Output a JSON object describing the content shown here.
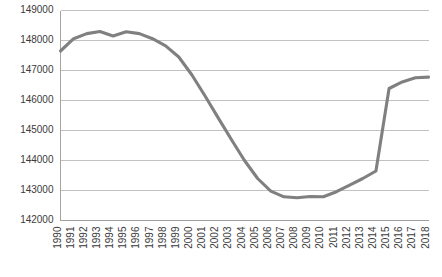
{
  "chart_data": {
    "type": "line",
    "title": "",
    "subtitle": "",
    "xlabel": "",
    "ylabel": "",
    "grid": "horizontal",
    "legend": "none",
    "line_color": "#808080",
    "gridline_color": "#b3b3b3",
    "background_color": "#ffffff",
    "ylim": [
      142000,
      149000
    ],
    "ytick_step": 1000,
    "ytick_labels": [
      "149000",
      "148000",
      "147000",
      "146000",
      "145000",
      "144000",
      "143000",
      "142000"
    ],
    "ytick_values": [
      149000,
      148000,
      147000,
      146000,
      145000,
      144000,
      143000,
      142000
    ],
    "categories": [
      "1990",
      "1991",
      "1992",
      "1993",
      "1994",
      "1995",
      "1996",
      "1997",
      "1998",
      "1999",
      "2000",
      "2001",
      "2002",
      "2003",
      "2004",
      "2005",
      "2006",
      "2007",
      "2008",
      "2009",
      "2010",
      "2011",
      "2012",
      "2013",
      "2014",
      "2015",
      "2016",
      "2017",
      "2018"
    ],
    "values": [
      147650,
      148060,
      148230,
      148300,
      148150,
      148290,
      148230,
      148060,
      147820,
      147450,
      146850,
      146150,
      145420,
      144700,
      144000,
      143400,
      142980,
      142790,
      142760,
      142800,
      142790,
      142960,
      143180,
      143400,
      143650,
      146400,
      146620,
      146760,
      146780
    ]
  }
}
